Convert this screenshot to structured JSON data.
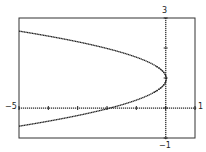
{
  "chart_data": {
    "type": "scatter",
    "title": "",
    "xlabel": "",
    "ylabel": "",
    "equation": "x = -2(y - 1)^2",
    "xlim": [
      -5,
      1
    ],
    "ylim": [
      -1,
      3
    ],
    "xtick_step": 1,
    "ytick_step": 1,
    "grid": false,
    "legend": null,
    "tick_labels": {
      "xmin": "−5",
      "xmax": "1",
      "ymax": "3",
      "ymin": "−1"
    },
    "series": [
      {
        "name": "parabola",
        "vertex": [
          0,
          1
        ],
        "points": [
          [
            -5,
            2.58
          ],
          [
            -4.5,
            2.5
          ],
          [
            -4,
            2.41
          ],
          [
            -3,
            2.22
          ],
          [
            -2,
            2.0
          ],
          [
            -1,
            1.71
          ],
          [
            -0.5,
            1.5
          ],
          [
            0,
            1.0
          ],
          [
            -0.5,
            0.5
          ],
          [
            -1,
            0.29
          ],
          [
            -2,
            0.0
          ],
          [
            -3,
            -0.22
          ],
          [
            -4,
            -0.41
          ],
          [
            -5,
            -0.58
          ]
        ]
      }
    ],
    "color": "#222222"
  }
}
